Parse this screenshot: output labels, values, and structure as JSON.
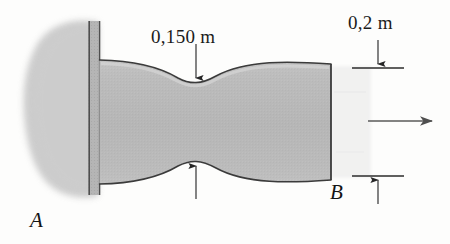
{
  "figure": {
    "background_color": "#fdfdfc"
  },
  "labels": {
    "waist_dimension": "0,150 m",
    "end_dimension": "0,2 m",
    "point_a": "A",
    "point_b": "B"
  },
  "colors": {
    "body_fill": "#b9b9b9",
    "body_fill_light": "#cfcfcf",
    "body_outline": "#3a3a3a",
    "wall_plate_fill": "#b4b4b4",
    "wall_blob_fill": "#cacaca",
    "dimension_line": "#2b2b2b",
    "force_arrow": "#555555"
  },
  "geometry": {
    "waist_x": 196,
    "waist_top_y": 82,
    "waist_bottom_y": 162,
    "left_end_x": 100,
    "left_top_y": 60,
    "left_bottom_y": 182,
    "right_end_x": 331,
    "right_top_y": 64,
    "right_bottom_y": 180,
    "wall_plate_x1": 88,
    "wall_plate_x2": 100
  },
  "annotations": {
    "force_arrow_direction": "right",
    "force_arrow_x_start": 368,
    "force_arrow_x_end": 437,
    "force_arrow_y": 121,
    "waist_arrow_top_y_start": 44,
    "waist_arrow_top_y_end": 79,
    "waist_arrow_bottom_y_start": 199,
    "waist_arrow_bottom_y_end": 165,
    "end_dim_line_y_top": 68,
    "end_dim_line_y_bottom": 176,
    "end_dim_line_x1": 352,
    "end_dim_line_x2": 404
  }
}
